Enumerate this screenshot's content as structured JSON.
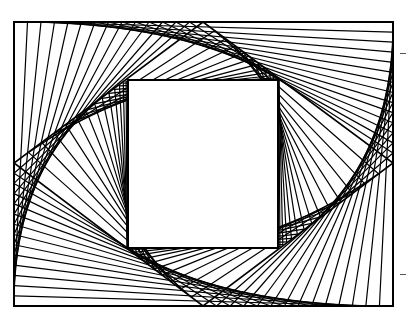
{
  "artwork": {
    "title": "",
    "stroke_color": "#000000",
    "background_color": "#ffffff",
    "outer_frame": {
      "x1": 14,
      "y1": 22,
      "x2": 393,
      "y2": 306
    },
    "diamond": {
      "top": [
        203,
        22
      ],
      "right": [
        393,
        163
      ],
      "bottom": [
        203,
        306
      ],
      "left": [
        14,
        163
      ]
    },
    "inner_square": {
      "x1": 128,
      "y1": 80,
      "x2": 278,
      "y2": 248
    },
    "fan_line_count_per_band": 14,
    "margin_ticks": [
      {
        "x": 400,
        "y": 53
      },
      {
        "x": 400,
        "y": 274
      }
    ]
  }
}
